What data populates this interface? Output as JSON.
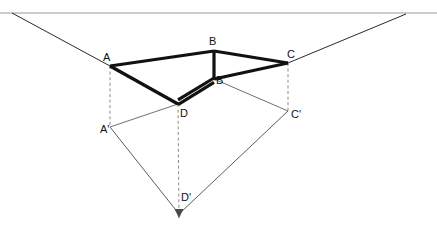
{
  "figure": {
    "type": "line-diagram",
    "canvas": {
      "width": 437,
      "height": 227,
      "background": "#ffffff"
    },
    "colors": {
      "ink": "#111111",
      "horizon": "#9a9a9a",
      "thin": "#4a4a4a",
      "dashed": "#7d7d7d",
      "background": "#ffffff"
    },
    "stroke_widths": {
      "heavy": 3.2,
      "medium": 1.1,
      "thin": 0.8,
      "horizon": 1.1,
      "dashed": 0.9
    }
  },
  "horizon": {
    "label": "horizon-line",
    "y": 13,
    "x_start": 0,
    "x_end": 437
  },
  "vanishing_points": [
    {
      "id": "VPL",
      "name": "left-vanishing-point",
      "x": 12,
      "y": 13
    },
    {
      "id": "VPR",
      "name": "right-vanishing-point",
      "x": 406,
      "y": 14
    }
  ],
  "points": {
    "A": {
      "x": 110,
      "y": 66,
      "label": "A",
      "label_x": 103,
      "label_y": 61
    },
    "B": {
      "x": 214,
      "y": 51,
      "label": "B",
      "label_x": 209,
      "label_y": 45
    },
    "C": {
      "x": 288,
      "y": 63,
      "label": "C",
      "label_x": 287,
      "label_y": 58
    },
    "Bp": {
      "x": 214,
      "y": 79,
      "label": "B'",
      "label_x": 216,
      "label_y": 84
    },
    "D": {
      "x": 178,
      "y": 104,
      "label": "D",
      "label_x": 180,
      "label_y": 117
    },
    "Ap": {
      "x": 110,
      "y": 127,
      "label": "A'",
      "label_x": 100,
      "label_y": 133
    },
    "Cp": {
      "x": 288,
      "y": 111,
      "label": "C'",
      "label_x": 291,
      "label_y": 118
    },
    "Dp": {
      "x": 179,
      "y": 214,
      "label": "D'",
      "label_x": 181,
      "label_y": 201
    }
  },
  "edges": {
    "heavy": [
      {
        "name": "edge-A-B",
        "from": "A",
        "to": "B"
      },
      {
        "name": "edge-B-C",
        "from": "B",
        "to": "C"
      },
      {
        "name": "edge-B-Bprime",
        "from": "B",
        "to": "Bp"
      },
      {
        "name": "edge-C-Bprime",
        "from": "C",
        "to": "Bp"
      },
      {
        "name": "edge-A-D",
        "from": "A",
        "to": "D"
      },
      {
        "name": "edge-D-Bprime-upper",
        "from": "D",
        "to": "Bp"
      },
      {
        "name": "edge-D-Bprime-lower",
        "from": "D",
        "to": "Bp"
      }
    ],
    "construction_solid": [
      {
        "name": "ray-VPL-to-A",
        "from": "VPL",
        "to": "A"
      },
      {
        "name": "ray-VPR-to-C",
        "from": "VPR",
        "to": "C"
      },
      {
        "name": "ray-Aprime-to-D",
        "from": "Ap",
        "to": "D"
      },
      {
        "name": "ray-Aprime-to-Dprime",
        "from": "Ap",
        "to": "Dp"
      },
      {
        "name": "ray-Cprime-to-Dprime",
        "from": "Cp",
        "to": "Dp"
      },
      {
        "name": "ray-Bprime-to-Cprime",
        "from": "Bp",
        "to": "Cp"
      }
    ],
    "dashed": [
      {
        "name": "drop-A-to-Aprime",
        "from": "A",
        "to": "Ap"
      },
      {
        "name": "drop-C-to-Cprime",
        "from": "C",
        "to": "Cp"
      },
      {
        "name": "drop-D-to-Dprime",
        "from": "D",
        "to": "Dp"
      }
    ]
  },
  "arrow": {
    "name": "down-arrow-at-Dprime",
    "tip_x": 179,
    "tip_y": 218,
    "half_width": 4.5,
    "length": 9
  }
}
